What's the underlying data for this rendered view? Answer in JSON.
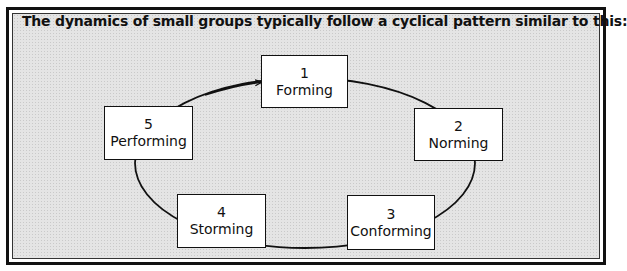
{
  "title": "The dynamics of small groups typically follow a cyclical pattern similar to this:",
  "colors": {
    "line": "#111111",
    "background": "#e4e4e4",
    "box": "#ffffff"
  },
  "stages": [
    {
      "number": "1",
      "label": "Forming"
    },
    {
      "number": "2",
      "label": "Norming"
    },
    {
      "number": "3",
      "label": "Conforming"
    },
    {
      "number": "4",
      "label": "Storming"
    },
    {
      "number": "5",
      "label": "Performing"
    }
  ],
  "cycle": {
    "direction": "clockwise",
    "arrow_into": "Forming"
  }
}
